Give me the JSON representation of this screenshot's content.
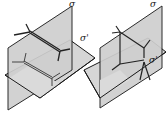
{
  "diagram": {
    "left": {
      "vertical_plane_label": "σ",
      "horizontal_plane_label": "σ'"
    },
    "right": {
      "vertical_plane_label": "σ",
      "horizontal_plane_label": "σ'"
    },
    "colors": {
      "plane_fill": "#d6d6d6",
      "plane_fill_dark": "#c4c4c4",
      "edge": "#1a1a1a",
      "bond": "#333333",
      "background": "#ffffff"
    }
  }
}
